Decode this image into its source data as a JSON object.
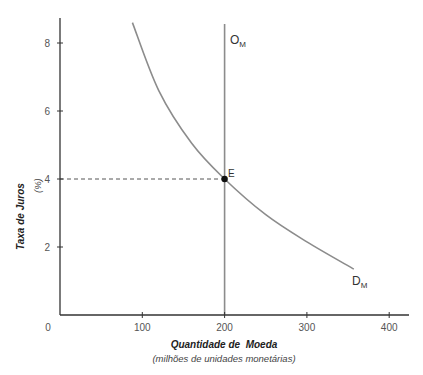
{
  "chart_data": {
    "type": "line",
    "title": "",
    "xlabel": "Quantidade de  Moeda",
    "xlabel_sub": "(milhões de unidades monetárias)",
    "ylabel": "Taxa de Juros",
    "ylabel_sub": "(%)",
    "xlim": [
      0,
      420
    ],
    "ylim": [
      0,
      8.8
    ],
    "x_ticks": [
      0,
      100,
      200,
      300,
      400
    ],
    "y_ticks": [
      2,
      4,
      6,
      8
    ],
    "x_tick_labels": [
      "0",
      "100",
      "200",
      "300",
      "400"
    ],
    "y_tick_labels": [
      "2",
      "4",
      "6",
      "8"
    ],
    "grid": false,
    "legend": null,
    "series": [
      {
        "name": "D_M",
        "label_main": "D",
        "label_sub": "M",
        "style": "curve",
        "color": "#8c8c8c",
        "x": [
          88,
          120,
          160,
          200,
          250,
          300,
          357
        ],
        "y": [
          8.6,
          6.6,
          5.05,
          4.0,
          2.95,
          2.15,
          1.35
        ]
      },
      {
        "name": "O_M",
        "label_main": "O",
        "label_sub": "M",
        "style": "vertical",
        "color": "#8c8c8c",
        "x": [
          200,
          200
        ],
        "y": [
          0,
          8.7
        ]
      }
    ],
    "annotations": [
      {
        "type": "point",
        "label": "E",
        "x": 200,
        "y": 4
      },
      {
        "type": "dashed-line",
        "from": [
          0,
          4
        ],
        "to": [
          200,
          4
        ],
        "color": "#555555"
      }
    ]
  },
  "colors": {
    "axis": "#333333",
    "curves": "#8c8c8c",
    "point": "#111111",
    "dashed": "#555555"
  }
}
